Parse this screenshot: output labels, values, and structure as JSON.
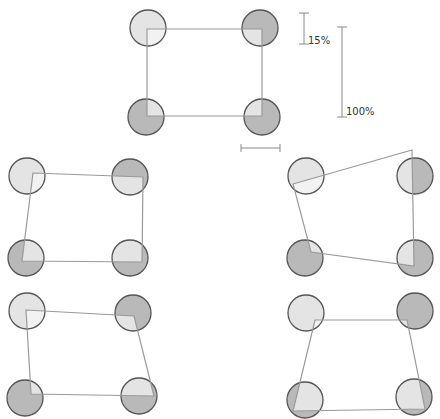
{
  "style": {
    "circle_dark": "#b9b9b9",
    "circle_light": "#e4e4e4",
    "circle_stroke": "#555555",
    "line_color": "#9a9a9a",
    "circle_radius": 18
  },
  "scale_bars": {
    "small_label": "15%",
    "large_label": "100%",
    "small": {
      "x": 304,
      "y1": 13,
      "y2": 44
    },
    "large": {
      "x": 342,
      "y1": 27,
      "y2": 117
    },
    "horizontal": {
      "y": 148,
      "x1": 241,
      "x2": 280
    }
  },
  "panels": [
    {
      "name": "reference",
      "circles": [
        [
          148,
          28
        ],
        [
          260,
          28
        ],
        [
          146,
          117
        ],
        [
          262,
          117
        ]
      ],
      "dark_circles": [
        1,
        2,
        3
      ],
      "quad": [
        [
          147,
          29
        ],
        [
          262,
          29
        ],
        [
          262,
          116
        ],
        [
          147,
          116
        ]
      ]
    },
    {
      "name": "middle-left",
      "circles": [
        [
          27,
          176
        ],
        [
          130,
          177
        ],
        [
          26,
          258
        ],
        [
          130,
          258
        ]
      ],
      "dark_circles": [
        1,
        2,
        3
      ],
      "quad": [
        [
          33,
          173
        ],
        [
          143,
          177
        ],
        [
          142,
          262
        ],
        [
          22,
          261
        ]
      ]
    },
    {
      "name": "middle-right",
      "circles": [
        [
          306,
          176
        ],
        [
          415,
          176
        ],
        [
          305,
          258
        ],
        [
          415,
          258
        ]
      ],
      "dark_circles": [
        1,
        2,
        3
      ],
      "quad": [
        [
          293,
          184
        ],
        [
          412,
          150
        ],
        [
          414,
          266
        ],
        [
          311,
          252
        ]
      ]
    },
    {
      "name": "bottom-left",
      "circles": [
        [
          27,
          311
        ],
        [
          133,
          313
        ],
        [
          25,
          398
        ],
        [
          139,
          396
        ]
      ],
      "dark_circles": [
        1,
        2,
        3
      ],
      "quad": [
        [
          26,
          310
        ],
        [
          134,
          316
        ],
        [
          154,
          396
        ],
        [
          31,
          394
        ]
      ]
    },
    {
      "name": "bottom-right",
      "circles": [
        [
          306,
          313
        ],
        [
          415,
          311
        ],
        [
          305,
          400
        ],
        [
          414,
          397
        ]
      ],
      "dark_circles": [
        1,
        2,
        3
      ],
      "quad": [
        [
          315,
          320
        ],
        [
          407,
          320
        ],
        [
          425,
          409
        ],
        [
          293,
          411
        ]
      ]
    }
  ]
}
